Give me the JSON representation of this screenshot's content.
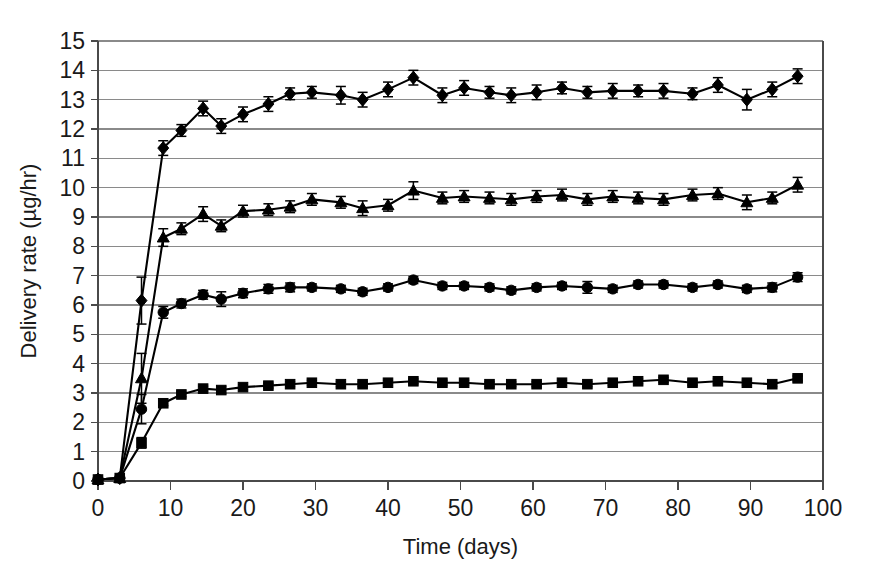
{
  "chart_data": {
    "type": "line",
    "title": "",
    "xlabel": "Time (days)",
    "ylabel": "Delivery rate (µg/hr)",
    "xlim": [
      0,
      100
    ],
    "ylim": [
      0,
      15
    ],
    "xticks": [
      0,
      10,
      20,
      30,
      40,
      50,
      60,
      70,
      80,
      90,
      100
    ],
    "yticks": [
      0,
      1,
      2,
      3,
      4,
      5,
      6,
      7,
      8,
      9,
      10,
      11,
      12,
      13,
      14,
      15
    ],
    "grid": "horizontal",
    "legend": "none",
    "error_bars": true,
    "line_color": "#000000",
    "grid_color": "#8a8a8a",
    "x": [
      0,
      3,
      6,
      9,
      11.5,
      14.5,
      17,
      20,
      23.5,
      26.5,
      29.5,
      33.5,
      36.5,
      40,
      43.5,
      47.5,
      50.5,
      54,
      57,
      60.5,
      64,
      67.5,
      71,
      74.5,
      78,
      82,
      85.5,
      89.5,
      93,
      96.5
    ],
    "series": [
      {
        "name": "series-diamond",
        "marker": "diamond",
        "values": [
          0.05,
          0.1,
          6.15,
          11.35,
          11.95,
          12.7,
          12.1,
          12.5,
          12.85,
          13.2,
          13.25,
          13.15,
          13.0,
          13.35,
          13.75,
          13.15,
          13.4,
          13.25,
          13.15,
          13.25,
          13.4,
          13.25,
          13.3,
          13.3,
          13.3,
          13.2,
          13.5,
          13.0,
          13.35,
          13.8
        ],
        "errors": [
          0.05,
          0.05,
          0.8,
          0.25,
          0.2,
          0.25,
          0.25,
          0.25,
          0.25,
          0.2,
          0.2,
          0.3,
          0.25,
          0.25,
          0.25,
          0.25,
          0.25,
          0.2,
          0.25,
          0.25,
          0.2,
          0.2,
          0.25,
          0.2,
          0.25,
          0.2,
          0.25,
          0.35,
          0.25,
          0.25
        ]
      },
      {
        "name": "series-triangle",
        "marker": "triangle",
        "values": [
          0.05,
          0.1,
          3.5,
          8.3,
          8.6,
          9.1,
          8.7,
          9.2,
          9.25,
          9.35,
          9.6,
          9.5,
          9.3,
          9.4,
          9.9,
          9.65,
          9.7,
          9.65,
          9.6,
          9.7,
          9.75,
          9.6,
          9.7,
          9.65,
          9.6,
          9.75,
          9.8,
          9.5,
          9.65,
          10.1
        ],
        "errors": [
          0.05,
          0.05,
          0.85,
          0.3,
          0.2,
          0.25,
          0.2,
          0.2,
          0.2,
          0.2,
          0.2,
          0.2,
          0.25,
          0.2,
          0.3,
          0.2,
          0.2,
          0.2,
          0.2,
          0.2,
          0.2,
          0.2,
          0.2,
          0.2,
          0.2,
          0.2,
          0.2,
          0.25,
          0.2,
          0.25
        ]
      },
      {
        "name": "series-circle",
        "marker": "circle",
        "values": [
          0.05,
          0.1,
          2.45,
          5.75,
          6.05,
          6.35,
          6.2,
          6.4,
          6.55,
          6.6,
          6.6,
          6.55,
          6.45,
          6.6,
          6.85,
          6.65,
          6.65,
          6.6,
          6.5,
          6.6,
          6.65,
          6.6,
          6.55,
          6.7,
          6.7,
          6.6,
          6.7,
          6.55,
          6.6,
          6.95
        ],
        "errors": [
          0.05,
          0.05,
          0.5,
          0.2,
          0.15,
          0.15,
          0.25,
          0.15,
          0.15,
          0.15,
          0.12,
          0.12,
          0.12,
          0.12,
          0.12,
          0.12,
          0.12,
          0.12,
          0.12,
          0.12,
          0.12,
          0.2,
          0.12,
          0.12,
          0.12,
          0.12,
          0.12,
          0.12,
          0.15,
          0.15
        ]
      },
      {
        "name": "series-square",
        "marker": "square",
        "values": [
          0.05,
          0.1,
          1.3,
          2.65,
          2.95,
          3.15,
          3.1,
          3.2,
          3.25,
          3.3,
          3.35,
          3.3,
          3.3,
          3.35,
          3.4,
          3.35,
          3.35,
          3.3,
          3.3,
          3.3,
          3.35,
          3.3,
          3.35,
          3.4,
          3.45,
          3.35,
          3.4,
          3.35,
          3.3,
          3.5
        ],
        "errors": [
          0.05,
          0.05,
          0.18,
          0.08,
          0.08,
          0.08,
          0.12,
          0.08,
          0.08,
          0.08,
          0.08,
          0.08,
          0.08,
          0.08,
          0.08,
          0.08,
          0.08,
          0.08,
          0.08,
          0.08,
          0.08,
          0.08,
          0.08,
          0.08,
          0.08,
          0.08,
          0.08,
          0.08,
          0.08,
          0.08
        ]
      }
    ]
  },
  "axes": {
    "y_title": "Delivery rate (µg/hr)",
    "x_title": "Time (days)"
  }
}
